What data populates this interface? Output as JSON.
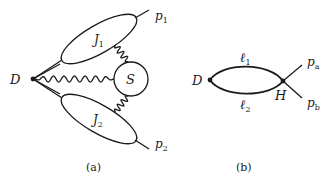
{
  "figure": {
    "panel_a": {
      "caption": "(a)",
      "vertex_label": "D",
      "soft_label": "S",
      "jet1_label": "J",
      "jet1_sub": "1",
      "jet2_label": "J",
      "jet2_sub": "2",
      "out1_label": "p",
      "out1_sub": "1",
      "out2_label": "p",
      "out2_sub": "2"
    },
    "panel_b": {
      "caption": "(b)",
      "left_vertex_label": "D",
      "right_vertex_label": "H",
      "upper_line_label": "ℓ",
      "upper_line_sub": "1",
      "lower_line_label": "ℓ",
      "lower_line_sub": "2",
      "out_a_label": "p",
      "out_a_sub": "a",
      "out_b_label": "p",
      "out_b_sub": "b"
    }
  }
}
